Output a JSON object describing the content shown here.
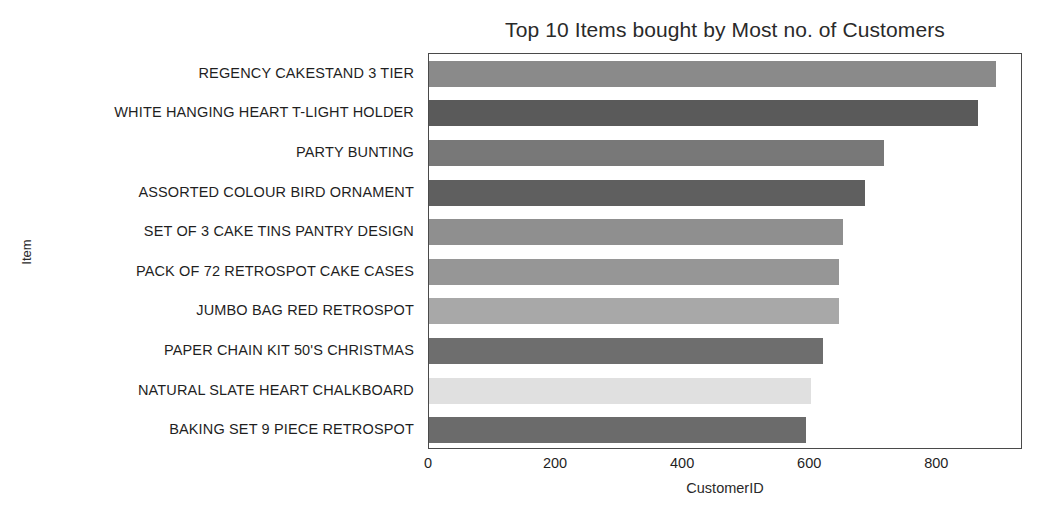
{
  "chart_data": {
    "type": "bar",
    "orientation": "horizontal",
    "title": "Top 10 Items bought by Most no. of Customers",
    "xlabel": "CustomerID",
    "ylabel": "Item",
    "categories": [
      "REGENCY CAKESTAND 3 TIER",
      "WHITE HANGING HEART T-LIGHT HOLDER",
      "PARTY BUNTING",
      "ASSORTED COLOUR BIRD ORNAMENT",
      "SET OF 3 CAKE TINS PANTRY DESIGN",
      "PACK OF 72 RETROSPOT CAKE CASES",
      "JUMBO BAG RED RETROSPOT",
      "PAPER CHAIN KIT 50'S CHRISTMAS",
      "NATURAL SLATE HEART CHALKBOARD",
      "BAKING SET 9 PIECE RETROSPOT"
    ],
    "values": [
      893,
      864,
      716,
      687,
      652,
      645,
      645,
      620,
      601,
      594
    ],
    "bar_colors": [
      "#8a8a8a",
      "#5a5a5a",
      "#787878",
      "#5f5f5f",
      "#8f8f8f",
      "#969696",
      "#a8a8a8",
      "#6e6e6e",
      "#e0e0e0",
      "#6b6b6b"
    ],
    "xlim": [
      0,
      935
    ],
    "xticks": [
      0,
      200,
      400,
      600,
      800
    ],
    "xtick_labels": [
      "0",
      "200",
      "400",
      "600",
      "800"
    ],
    "grid": false,
    "legend": false
  }
}
